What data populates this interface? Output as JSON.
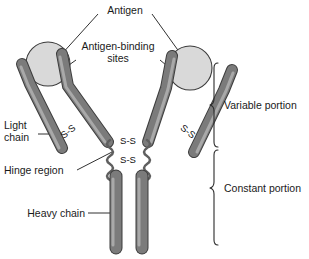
{
  "figure": {
    "background_color": "#ffffff"
  },
  "labels": {
    "antigen": "Antigen",
    "antigen_binding_line1": "Antigen-binding",
    "antigen_binding_line2": "sites",
    "light_chain_line1": "Light",
    "light_chain_line2": "chain",
    "hinge_region": "Hinge region",
    "heavy_chain": "Heavy chain",
    "variable_portion": "Variable portion",
    "constant_portion": "Constant portion"
  },
  "disulfide_bonds": {
    "label": "S-S",
    "bonds": [
      {
        "id": "left-light-heavy",
        "text": "S-S",
        "x": 70,
        "y": 134,
        "rotation": -38
      },
      {
        "id": "right-light-heavy",
        "text": "S-S",
        "x": 186,
        "y": 134,
        "rotation": 38
      },
      {
        "id": "hinge-upper",
        "text": "S-S",
        "x": 128,
        "y": 141,
        "rotation": 0
      },
      {
        "id": "hinge-lower",
        "text": "S-S",
        "x": 128,
        "y": 160,
        "rotation": 0
      }
    ]
  },
  "colors": {
    "chain_fill": "#7b7b7b",
    "chain_outline": "#3d3d3d",
    "chain_highlight": "#a9a9a9",
    "antigen_fill": "#d9d9d9",
    "antigen_outline": "#3a3a3a",
    "text": "#1a1a1a",
    "leader_line": "#1a1a1a"
  },
  "antigens": [
    {
      "id": "antigen-left",
      "cx": 48,
      "cy": 64,
      "r": 22
    },
    {
      "id": "antigen-right",
      "cx": 190,
      "cy": 68,
      "r": 22
    }
  ],
  "chains": [
    {
      "id": "light-chain-left",
      "type": "light"
    },
    {
      "id": "light-chain-right",
      "type": "light"
    },
    {
      "id": "heavy-chain-left-upper",
      "type": "heavy-variable"
    },
    {
      "id": "heavy-chain-right-upper",
      "type": "heavy-variable"
    },
    {
      "id": "heavy-chain-left-lower",
      "type": "heavy-constant"
    },
    {
      "id": "heavy-chain-right-lower",
      "type": "heavy-constant"
    }
  ],
  "brackets": [
    {
      "id": "variable-bracket",
      "label": "Variable portion",
      "y_top": 62,
      "y_bottom": 148
    },
    {
      "id": "constant-bracket",
      "label": "Constant portion",
      "y_top": 149,
      "y_bottom": 246
    }
  ]
}
